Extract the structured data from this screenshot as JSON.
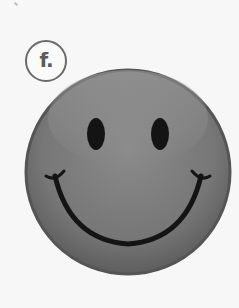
{
  "label": {
    "text": "f."
  },
  "face": {
    "type": "smiley",
    "expression": "smiling",
    "colors": {
      "face_fill": "#7a7a7a",
      "face_edge": "#555555",
      "highlight": "#959595",
      "features": "#141414",
      "background": "#f7f7f7",
      "label_border": "#6a6a6a"
    }
  }
}
